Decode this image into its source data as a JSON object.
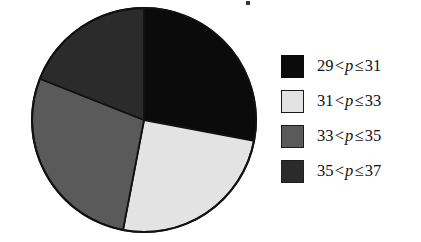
{
  "figure": {
    "kind": "pie-chart-with-legend",
    "background_color": "#ffffff"
  },
  "chart_data": {
    "type": "pie",
    "title": "",
    "subtitle": "",
    "xlabel": "",
    "ylabel": "",
    "grid": false,
    "legend_position": "right",
    "center": {
      "x": 144,
      "y": 120
    },
    "radius": 112,
    "start_angle_deg": 0,
    "direction": "clockwise",
    "categories": [
      "29 < p ≤ 31",
      "31 < p ≤ 33",
      "33 < p ≤ 35",
      "35 < p ≤ 37"
    ],
    "values": [
      28,
      25,
      28,
      19
    ],
    "value_unit": "percent",
    "angles_deg": [
      100.8,
      90.0,
      100.8,
      68.4
    ],
    "slices": [
      {
        "label": "29 < p ≤ 31",
        "lower": 29,
        "upper": 31,
        "value": 28,
        "start_deg": 0,
        "end_deg": 100.8,
        "color": "#0b0b0b",
        "swatch_class": "swatch-black"
      },
      {
        "label": "31 < p ≤ 33",
        "lower": 31,
        "upper": 33,
        "value": 25,
        "start_deg": 100.8,
        "end_deg": 190.8,
        "color": "#e3e3e3",
        "swatch_class": "swatch-light"
      },
      {
        "label": "33 < p ≤ 35",
        "lower": 33,
        "upper": 35,
        "value": 28,
        "start_deg": 190.8,
        "end_deg": 291.6,
        "color": "#5a5a5a",
        "swatch_class": "swatch-medium"
      },
      {
        "label": "35 < p ≤ 37",
        "lower": 35,
        "upper": 37,
        "value": 19,
        "start_deg": 291.6,
        "end_deg": 360,
        "color": "#2b2b2b",
        "swatch_class": "swatch-dark"
      }
    ],
    "outline_color": "#111111"
  },
  "legend": {
    "items": [
      {
        "swatch_color": "#0b0b0b",
        "lower": "29",
        "op_left": "<",
        "variable": "p",
        "op_right": "≤",
        "upper": "31",
        "text": "29 < p ≤ 31"
      },
      {
        "swatch_color": "#e3e3e3",
        "lower": "31",
        "op_left": "<",
        "variable": "p",
        "op_right": "≤",
        "upper": "33",
        "text": "31 < p ≤ 33"
      },
      {
        "swatch_color": "#5a5a5a",
        "lower": "33",
        "op_left": "<",
        "variable": "p",
        "op_right": "≤",
        "upper": "35",
        "text": "33 < p ≤ 35"
      },
      {
        "swatch_color": "#2b2b2b",
        "lower": "35",
        "op_left": "<",
        "variable": "p",
        "op_right": "≤",
        "upper": "37",
        "text": "35 < p ≤ 37"
      }
    ]
  }
}
